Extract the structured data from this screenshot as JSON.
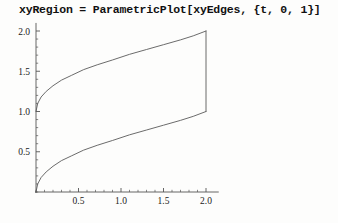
{
  "notebook": {
    "input_line": "xyRegion = ParametricPlot[xyEdges, {t, 0, 1}]"
  },
  "chart_data": {
    "type": "line",
    "title": "",
    "xlabel": "",
    "ylabel": "",
    "xlim": [
      0,
      2.15
    ],
    "ylim": [
      0,
      2.1
    ],
    "grid": false,
    "legend": false,
    "axis_color": "#555555",
    "curve_color": "#5a5a5a",
    "xticks": [
      0.5,
      1.0,
      1.5,
      2.0
    ],
    "xtick_labels": [
      "0.5",
      "1.0",
      "1.5",
      "2.0"
    ],
    "yticks": [
      0.5,
      1.0,
      1.5,
      2.0
    ],
    "ytick_labels": [
      "0.5",
      "1.0",
      "1.5",
      "2.0"
    ],
    "minor_ticks_per_interval": 4,
    "series": [
      {
        "name": "lower-edge",
        "comment": "x = 2t, y = sqrt(t) style rise from (0,0) to (2,1)",
        "points": [
          [
            0.0,
            0.0
          ],
          [
            0.02,
            0.1
          ],
          [
            0.06,
            0.18
          ],
          [
            0.12,
            0.25
          ],
          [
            0.2,
            0.32
          ],
          [
            0.3,
            0.39
          ],
          [
            0.42,
            0.45
          ],
          [
            0.56,
            0.52
          ],
          [
            0.72,
            0.58
          ],
          [
            0.9,
            0.64
          ],
          [
            1.1,
            0.71
          ],
          [
            1.3,
            0.77
          ],
          [
            1.5,
            0.83
          ],
          [
            1.7,
            0.89
          ],
          [
            1.85,
            0.94
          ],
          [
            2.0,
            1.0
          ]
        ]
      },
      {
        "name": "upper-edge",
        "comment": "rises from (0,1) to (2,2)",
        "points": [
          [
            0.0,
            1.0
          ],
          [
            0.02,
            1.1
          ],
          [
            0.06,
            1.18
          ],
          [
            0.12,
            1.25
          ],
          [
            0.2,
            1.32
          ],
          [
            0.3,
            1.39
          ],
          [
            0.42,
            1.45
          ],
          [
            0.56,
            1.52
          ],
          [
            0.72,
            1.58
          ],
          [
            0.9,
            1.64
          ],
          [
            1.1,
            1.71
          ],
          [
            1.3,
            1.77
          ],
          [
            1.5,
            1.83
          ],
          [
            1.7,
            1.89
          ],
          [
            1.85,
            1.94
          ],
          [
            2.0,
            2.0
          ]
        ]
      },
      {
        "name": "right-edge",
        "comment": "vertical closing segment at x = 2",
        "points": [
          [
            2.0,
            1.0
          ],
          [
            2.0,
            2.0
          ]
        ]
      }
    ]
  }
}
